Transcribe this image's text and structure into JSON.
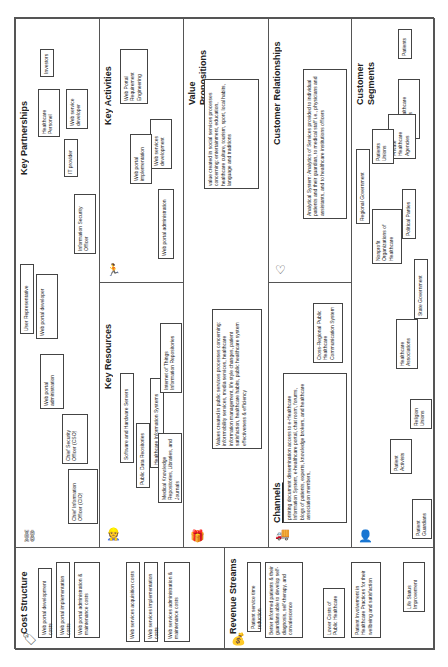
{
  "sections": {
    "key_partnerships": {
      "title": "Key Partnerships",
      "icon": "chain-link-icon",
      "items": [
        "Healthcare Personel",
        "Investors",
        "IT provider",
        "Web service developer",
        "Information Security Officer",
        "User Representative",
        "Web portal developer",
        "Web portal administration",
        "Chief Security Officer (CSO)",
        "Chief Information Officer (CIO)"
      ]
    },
    "key_activities": {
      "title": "Key Activities",
      "icon": "activity-person-icon",
      "items": [
        "Web Portal Requirement Engineering",
        "Web services development",
        "Web portal implementation",
        "Web portal administration"
      ]
    },
    "key_resources": {
      "title": "Key Resources",
      "icon": "worker-icon",
      "items": [
        "Software and Hardware Servers",
        "Public Data Reositories",
        "Healthcare Information Systems",
        "Medical Knowledge Repositories, Libraries, and Journals",
        "Internet of Things Information Repositories"
      ]
    },
    "value_propositions": {
      "title": "Value Propositions",
      "icon": "gift-icon",
      "items": [
        "Values created in public services processes concerning: inforrmobility services, media services, healthcare information management, life style changes, patient satisfaction, healthcare habits, public healthcare system effectiveness & efficiency",
        "value created in social services processes concerning: entertainment, education, healthcare culture, tourism, sport, local habits, language and traditions"
      ]
    },
    "customer_relationships": {
      "title": "Customer Relationships",
      "icon": "heart-icon",
      "items": [
        "Analytical System: Analytics of Services provided to individual patients and their guardian, to medical staff i.e., physicians and assistants, and to healthcare institutions officers"
      ]
    },
    "channels": {
      "title": "Channels",
      "icon": "truck-icon",
      "items": [
        "printing document dissemination access to e-Healthcare Information System, e-healthcare portal, chat room, forums, blogs of patients, experts, knowledge brokers, and healthcare association members,",
        "Cross-Regional Public Healthcare Communication System"
      ]
    },
    "customer_segments": {
      "title": "Customer Segments",
      "icon": "person-icon",
      "items": [
        "Patients",
        "Patient Guardians",
        "Public Healthcare Institutions",
        "Private Healthcare Agencies",
        "Healthcare Associations",
        "Nonprofit Organizations of Healthcare",
        "Religion Unions",
        "Political Parties",
        "State Government",
        "Regional Government",
        "Patients Unions",
        "Patient Activists"
      ]
    },
    "cost_structure": {
      "title": "Cost Structure",
      "icon": "price-tag-icon",
      "items": [
        "Web portal development costs",
        "Web portal implementation costs",
        "Web portal administration & maintenance costs",
        "Web services acquisition costs",
        "Web services implementation costs",
        "Web services administration & maintenance costs"
      ]
    },
    "revenue_streams": {
      "title": "Revenue Streams",
      "icon": "money-bag-icon",
      "items": [
        "Patient service time reduction",
        "Better informed patients & their guardians able to develop self-diagnosis, self-therapy, and convalescence",
        "Lower Costs of Public Healthcare",
        "Patient Involvement in Healthcare Practices for their wellbeing and satisfaction",
        "Life Status Improvement"
      ]
    }
  }
}
